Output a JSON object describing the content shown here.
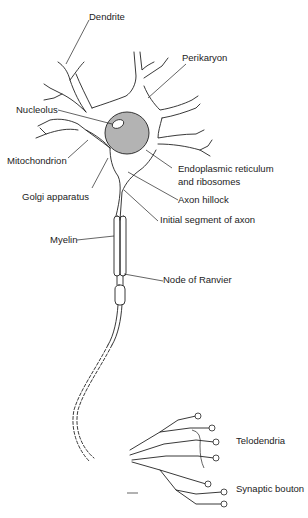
{
  "diagram": {
    "type": "neuron-anatomy",
    "colors": {
      "line": "#222222",
      "nucleus": "#b3b3b3",
      "background": "#ffffff"
    },
    "labels": {
      "dendrite": "Dendrite",
      "perikaryon": "Perikaryon",
      "nucleolus": "Nucleolus",
      "mitochondrion": "Mitochondrion",
      "endoplasmic_1": "Endoplasmic reticulum",
      "endoplasmic_2": "and ribosomes",
      "golgi": "Golgi apparatus",
      "axon_hillock": "Axon hillock",
      "initial_segment": "Initial segment of axon",
      "myelin": "Myelin",
      "node_of_ranvier": "Node of Ranvier",
      "telodendria": "Telodendria",
      "synaptic_bouton": "Synaptic bouton"
    }
  }
}
